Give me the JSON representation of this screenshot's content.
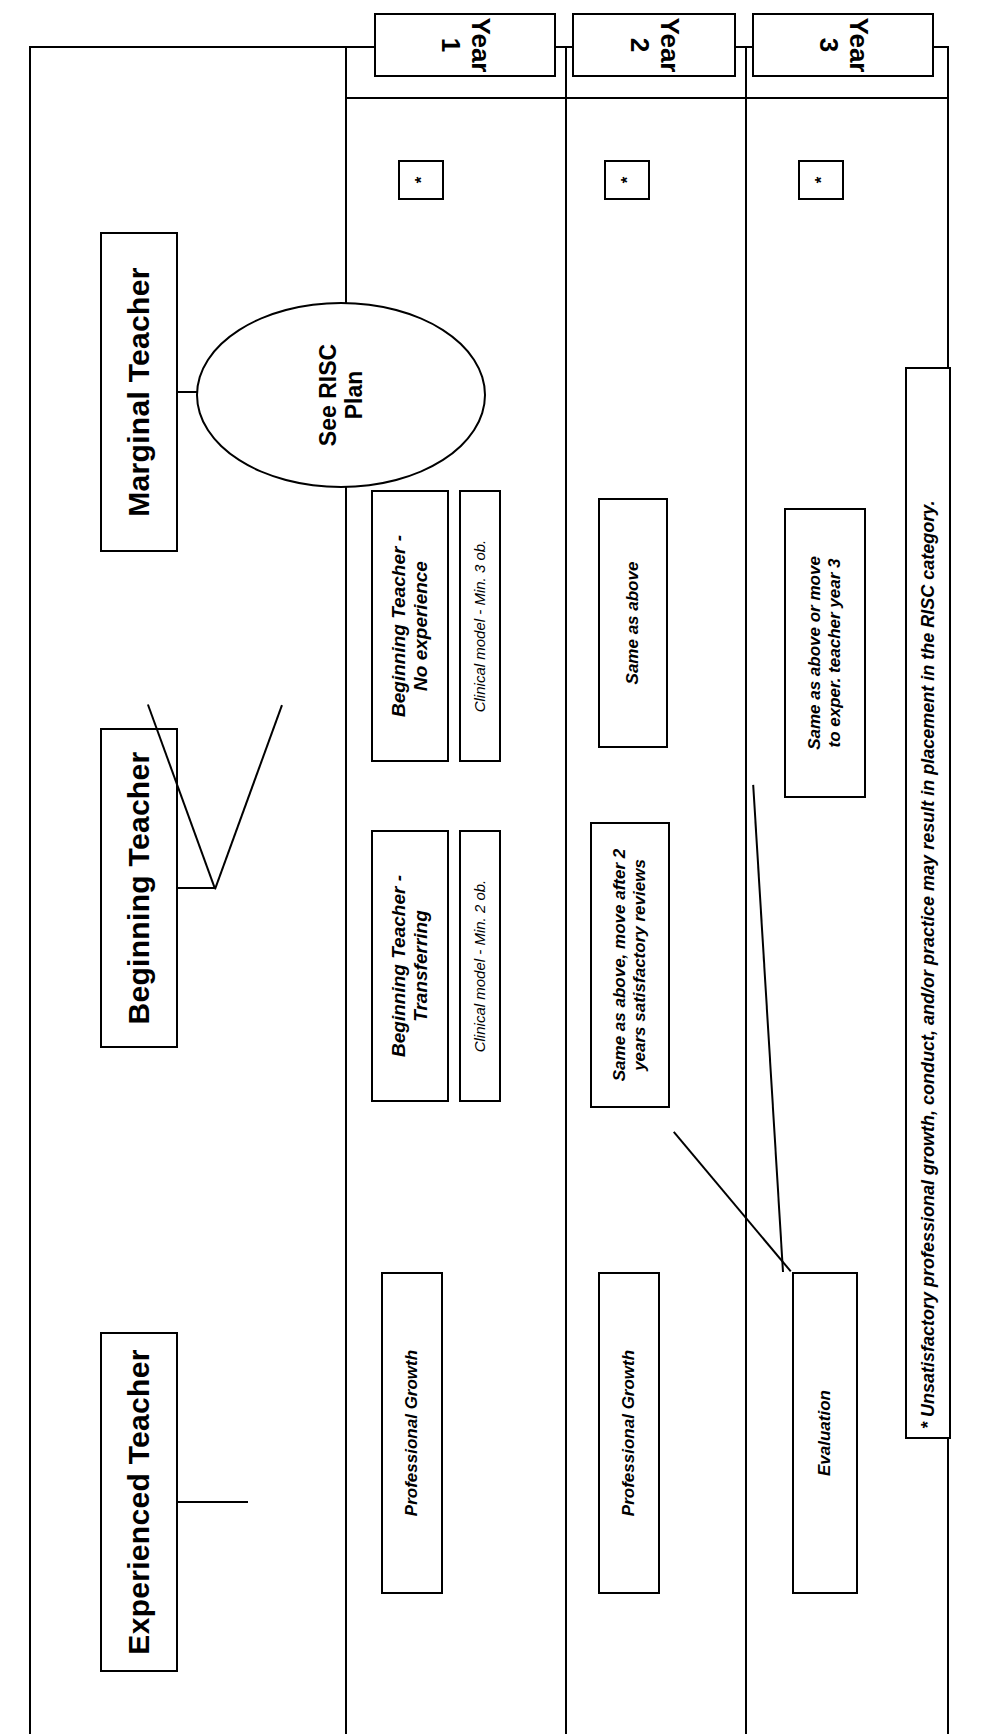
{
  "document": {
    "type": "flowchart",
    "orientation": "rotated-90-ccw"
  },
  "columns": [
    {
      "id": "experienced",
      "header": "Experienced Teacher"
    },
    {
      "id": "beginning",
      "header": "Beginning Teacher"
    },
    {
      "id": "marginal",
      "header": "Marginal Teacher"
    }
  ],
  "rows": [
    {
      "id": "year1",
      "label": "Year 1"
    },
    {
      "id": "year2",
      "label": "Year 2"
    },
    {
      "id": "year3",
      "label": "Year 3"
    }
  ],
  "nodes": {
    "marginal_risc": "See RISC\nPlan",
    "beginning_no_experience": "Beginning Teacher -\nNo experience",
    "beginning_no_experience_detail": "Clinical model - Min. 3 ob.",
    "beginning_transferring": "Beginning Teacher -\nTransferring",
    "beginning_transferring_detail": "Clinical model - Min. 2 ob.",
    "beginning_year2_no_exp": "Same as above",
    "beginning_year2_transfer": "Same as above, move after 2\nyears satisfactory reviews",
    "beginning_year3": "Same as above or move\nto exper. teacher year 3",
    "experienced_year1": "Professional Growth",
    "experienced_year2": "Professional Growth",
    "experienced_year3": "Evaluation",
    "asterisk": "*"
  },
  "footnote": {
    "text": "* Unsatisfactory professional growth, conduct, and/or practice may result in placement in the RISC category."
  },
  "colors": {
    "ink": "#000000",
    "paper": "#ffffff"
  }
}
